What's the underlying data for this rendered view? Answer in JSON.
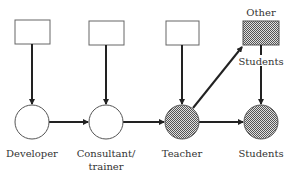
{
  "diagram": {
    "nodes": [
      {
        "id": "developer",
        "label": "Developer",
        "shaded": false
      },
      {
        "id": "consultant",
        "label_line1": "Consultant/",
        "label_line2": "trainer",
        "shaded": false
      },
      {
        "id": "teacher",
        "label": "Teacher",
        "shaded": true
      },
      {
        "id": "students",
        "label": "Students",
        "shaded": true
      }
    ],
    "other_students": {
      "label_top": "Other",
      "label_bottom": "Students",
      "shaded": true
    },
    "edges": [
      "box1->developer",
      "box2->consultant",
      "box3->teacher",
      "box4->students",
      "developer->consultant",
      "consultant->teacher",
      "teacher->students",
      "teacher->other_students"
    ],
    "colors": {
      "stroke": "#333333",
      "line": "#222222",
      "shade": "#aaaaaa"
    }
  }
}
